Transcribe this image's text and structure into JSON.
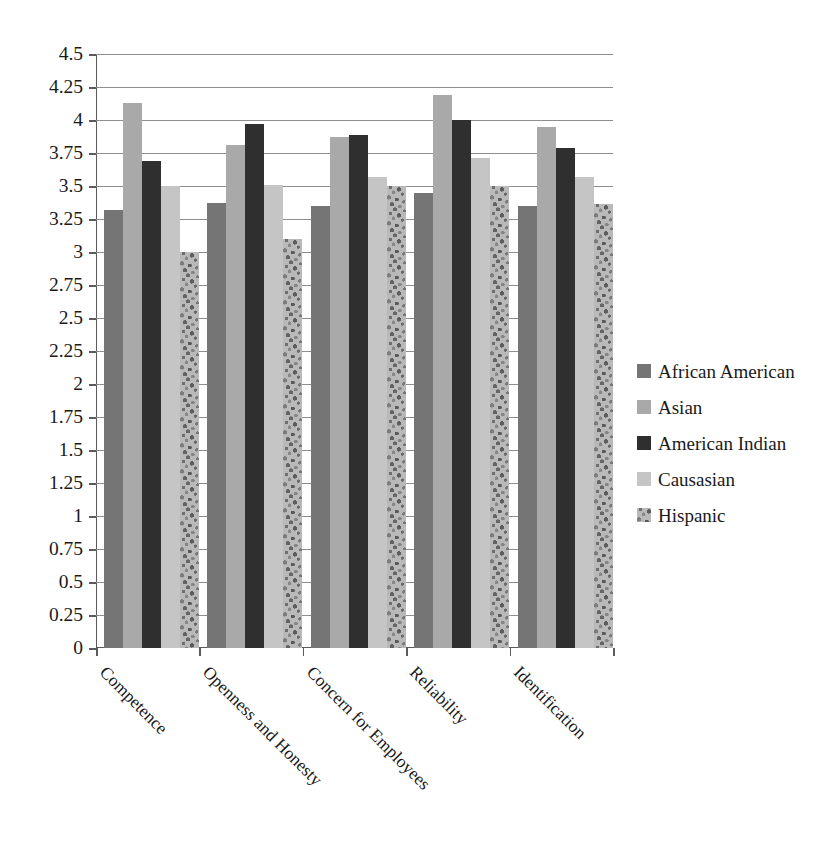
{
  "chart_data": {
    "type": "bar",
    "title": "",
    "subtitle": "",
    "xlabel": "",
    "ylabel": "",
    "categories": [
      "Competence",
      "Openness and Honesty",
      "Concern for Employees",
      "Reliability",
      "Identification"
    ],
    "series": [
      {
        "name": "African American",
        "color": "#757575",
        "values": [
          3.32,
          3.37,
          3.35,
          3.45,
          3.35
        ]
      },
      {
        "name": "Asian",
        "color": "#a9a9a9",
        "values": [
          4.13,
          3.81,
          3.87,
          4.19,
          3.95
        ]
      },
      {
        "name": "American Indian",
        "color": "#2f2f2f",
        "values": [
          3.69,
          3.97,
          3.89,
          4.0,
          3.79
        ]
      },
      {
        "name": "Causasian",
        "color": "#c5c5c5",
        "values": [
          3.5,
          3.51,
          3.57,
          3.71,
          3.57
        ]
      },
      {
        "name": "Hispanic",
        "color": "#b9b9b9",
        "values": [
          3.0,
          3.1,
          3.5,
          3.5,
          3.36
        ]
      }
    ],
    "ylim": [
      0,
      4.5
    ],
    "ytick_step": 0.25,
    "ytick_labels": [
      "0",
      "0.25",
      "0.5",
      "0.75",
      "1",
      "1.25",
      "1.5",
      "1.75",
      "2",
      "2.25",
      "2.5",
      "2.75",
      "3",
      "3.25",
      "3.5",
      "3.75",
      "4",
      "4.25",
      "4.5"
    ],
    "ytick_values": [
      0,
      0.25,
      0.5,
      0.75,
      1,
      1.25,
      1.5,
      1.75,
      2,
      2.25,
      2.5,
      2.75,
      3,
      3.25,
      3.5,
      3.75,
      4,
      4.25,
      4.5
    ],
    "grid": true,
    "grid_axis": "y",
    "legend_position": "right",
    "xtick_label_rotation": -45
  }
}
